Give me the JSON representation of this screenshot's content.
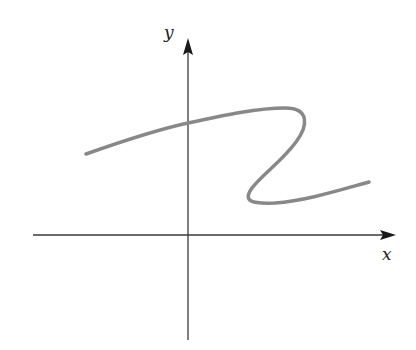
{
  "figure": {
    "type": "coordinate-plane-sketch",
    "axes": {
      "x_label": "x",
      "y_label": "y",
      "axis_color": "#3a3a3a",
      "origin_px": [
        188,
        235
      ],
      "x_axis_px": {
        "from": 33,
        "to": 395
      },
      "y_axis_px": {
        "from": 340,
        "to": 40
      }
    },
    "curve": {
      "color": "#888888",
      "stroke_width": 3.5,
      "description": "S-shaped curve that is not a function of x: rises from lower-left, crosses the y-axis, turns back at the right, sweeps down-left, then turns right again and rises slightly",
      "path_px": "M86,154 C120,142 160,129 188,123 C225,115 258,108 285,108 C310,108 308,126 296,142 C283,160 262,175 252,188 C243,201 250,204 275,203 C305,201 340,190 369,182"
    }
  }
}
